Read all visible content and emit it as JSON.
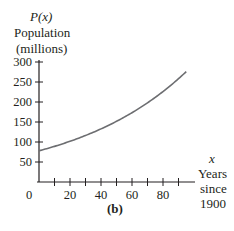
{
  "chart_data": {
    "type": "line",
    "title": "",
    "caption": "(b)",
    "ylabel_lines": [
      "P(x)",
      "Population",
      "(millions)"
    ],
    "xlabel_lines": [
      "x",
      "Years",
      "since",
      "1900"
    ],
    "x_ticks": [
      0,
      10,
      20,
      30,
      40,
      50,
      60,
      70,
      80,
      90
    ],
    "x_tick_labels": [
      "0",
      "20",
      "40",
      "60",
      "80"
    ],
    "y_ticks": [
      50,
      100,
      150,
      200,
      250,
      300
    ],
    "y_tick_labels": [
      "50",
      "100",
      "150",
      "200",
      "250",
      "300"
    ],
    "xlim": [
      0,
      100
    ],
    "ylim": [
      0,
      300
    ],
    "grid": false,
    "series": [
      {
        "name": "P(x)",
        "x": [
          0,
          10,
          20,
          30,
          40,
          50,
          60,
          70,
          80,
          90,
          95
        ],
        "y": [
          78,
          89,
          102,
          116,
          132,
          151,
          173,
          197,
          225,
          257,
          276
        ]
      }
    ]
  }
}
